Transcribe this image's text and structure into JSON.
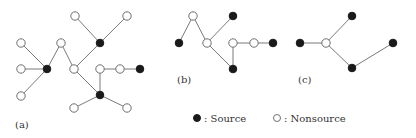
{
  "figure": {
    "panels": [
      {
        "label": "(a)",
        "label_pos": [
          15,
          128
        ],
        "nodes": [
          {
            "id": "a1",
            "x": 75,
            "y": 16,
            "type": "nonsource"
          },
          {
            "id": "a2",
            "x": 127,
            "y": 16,
            "type": "nonsource"
          },
          {
            "id": "a3",
            "x": 100,
            "y": 43,
            "type": "source"
          },
          {
            "id": "a4",
            "x": 21,
            "y": 43,
            "type": "nonsource"
          },
          {
            "id": "a5",
            "x": 61,
            "y": 43,
            "type": "nonsource"
          },
          {
            "id": "a6",
            "x": 47,
            "y": 69,
            "type": "source"
          },
          {
            "id": "a7",
            "x": 21,
            "y": 69,
            "type": "nonsource"
          },
          {
            "id": "a8",
            "x": 74,
            "y": 69,
            "type": "nonsource"
          },
          {
            "id": "a9",
            "x": 100,
            "y": 69,
            "type": "nonsource"
          },
          {
            "id": "a10",
            "x": 120,
            "y": 69,
            "type": "nonsource"
          },
          {
            "id": "a11",
            "x": 140,
            "y": 69,
            "type": "source"
          },
          {
            "id": "a12",
            "x": 21,
            "y": 96,
            "type": "nonsource"
          },
          {
            "id": "a13",
            "x": 100,
            "y": 95,
            "type": "source"
          },
          {
            "id": "a14",
            "x": 74,
            "y": 108,
            "type": "nonsource"
          },
          {
            "id": "a15",
            "x": 127,
            "y": 108,
            "type": "nonsource"
          }
        ],
        "edges": [
          [
            "a1",
            "a3"
          ],
          [
            "a2",
            "a3"
          ],
          [
            "a3",
            "a8"
          ],
          [
            "a4",
            "a6"
          ],
          [
            "a7",
            "a6"
          ],
          [
            "a12",
            "a6"
          ],
          [
            "a6",
            "a5"
          ],
          [
            "a5",
            "a8"
          ],
          [
            "a8",
            "a13"
          ],
          [
            "a9",
            "a13"
          ],
          [
            "a9",
            "a10"
          ],
          [
            "a10",
            "a11"
          ],
          [
            "a13",
            "a14"
          ],
          [
            "a13",
            "a15"
          ]
        ]
      },
      {
        "label": "(b)",
        "label_pos": [
          177,
          83
        ],
        "nodes": [
          {
            "id": "b1",
            "x": 193,
            "y": 16,
            "type": "nonsource"
          },
          {
            "id": "b2",
            "x": 233,
            "y": 16,
            "type": "source"
          },
          {
            "id": "b3",
            "x": 179,
            "y": 43,
            "type": "source"
          },
          {
            "id": "b4",
            "x": 207,
            "y": 43,
            "type": "nonsource"
          },
          {
            "id": "b5",
            "x": 233,
            "y": 43,
            "type": "nonsource"
          },
          {
            "id": "b6",
            "x": 254,
            "y": 43,
            "type": "nonsource"
          },
          {
            "id": "b7",
            "x": 273,
            "y": 43,
            "type": "source"
          },
          {
            "id": "b8",
            "x": 233,
            "y": 69,
            "type": "source"
          }
        ],
        "edges": [
          [
            "b3",
            "b1"
          ],
          [
            "b1",
            "b4"
          ],
          [
            "b4",
            "b2"
          ],
          [
            "b4",
            "b8"
          ],
          [
            "b5",
            "b8"
          ],
          [
            "b5",
            "b6"
          ],
          [
            "b6",
            "b7"
          ]
        ]
      },
      {
        "label": "(c)",
        "label_pos": [
          298,
          83
        ],
        "nodes": [
          {
            "id": "c1",
            "x": 300,
            "y": 43,
            "type": "source"
          },
          {
            "id": "c2",
            "x": 326,
            "y": 43,
            "type": "nonsource"
          },
          {
            "id": "c3",
            "x": 352,
            "y": 16,
            "type": "source"
          },
          {
            "id": "c4",
            "x": 352,
            "y": 68,
            "type": "source"
          },
          {
            "id": "c5",
            "x": 393,
            "y": 43,
            "type": "source"
          }
        ],
        "edges": [
          [
            "c1",
            "c2"
          ],
          [
            "c2",
            "c3"
          ],
          [
            "c2",
            "c4"
          ],
          [
            "c4",
            "c5"
          ]
        ]
      }
    ],
    "legend": {
      "source": {
        "symbol": "filled-circle",
        "label": ": Source",
        "x": 197,
        "y": 118
      },
      "nonsource": {
        "symbol": "open-circle",
        "label": ": Nonsource",
        "x": 277,
        "y": 118
      }
    },
    "colors": {
      "edge": "#7a7a7a",
      "source_fill": "#1a1a1a",
      "nonsource_fill": "#ffffff",
      "nonsource_stroke": "#6f6f6f",
      "text": "#333333"
    }
  }
}
